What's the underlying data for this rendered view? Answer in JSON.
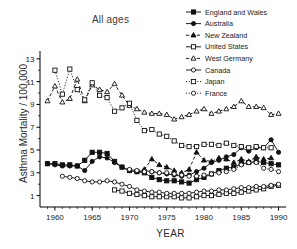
{
  "chart_data": {
    "type": "line",
    "title": "All ages",
    "xlabel": "YEAR",
    "ylabel": "Asthma Mortality / 100,000",
    "xlim": [
      1958,
      1991
    ],
    "ylim": [
      0,
      13.6
    ],
    "xticks": [
      1960,
      1965,
      1970,
      1975,
      1980,
      1985,
      1990
    ],
    "yticks": [
      1,
      3,
      5,
      7,
      9,
      11,
      13
    ],
    "yminor": [
      2,
      4,
      6,
      8,
      10,
      12
    ],
    "grid": false,
    "legend_position": "top-right",
    "series": [
      {
        "name": "England and Wales",
        "marker": "filled-square",
        "line": "solid",
        "color": "#111111",
        "points": [
          [
            1959,
            3.8
          ],
          [
            1960,
            3.8
          ],
          [
            1961,
            3.7
          ],
          [
            1962,
            3.7
          ],
          [
            1963,
            3.6
          ],
          [
            1964,
            4.1
          ],
          [
            1965,
            4.8
          ],
          [
            1966,
            4.8
          ],
          [
            1967,
            4.7
          ],
          [
            1968,
            4.0
          ],
          [
            1969,
            3.5
          ],
          [
            1970,
            3.2
          ],
          [
            1971,
            3.1
          ],
          [
            1972,
            3.0
          ],
          [
            1973,
            2.6
          ],
          [
            1974,
            2.4
          ],
          [
            1975,
            2.3
          ],
          [
            1976,
            2.3
          ],
          [
            1977,
            2.2
          ],
          [
            1978,
            2.1
          ],
          [
            1979,
            2.4
          ],
          [
            1980,
            2.6
          ],
          [
            1981,
            2.9
          ],
          [
            1982,
            3.2
          ],
          [
            1983,
            3.4
          ],
          [
            1984,
            3.5
          ],
          [
            1985,
            3.8
          ],
          [
            1986,
            3.9
          ],
          [
            1987,
            4.0
          ],
          [
            1988,
            3.9
          ],
          [
            1989,
            3.8
          ],
          [
            1990,
            3.7
          ]
        ]
      },
      {
        "name": "Australia",
        "marker": "filled-circle",
        "line": "solid",
        "color": "#111111",
        "points": [
          [
            1959,
            3.8
          ],
          [
            1960,
            3.7
          ],
          [
            1961,
            3.6
          ],
          [
            1962,
            3.6
          ],
          [
            1963,
            3.6
          ],
          [
            1964,
            3.2
          ],
          [
            1965,
            4.0
          ],
          [
            1966,
            4.4
          ],
          [
            1967,
            4.3
          ],
          [
            1968,
            3.9
          ],
          [
            1969,
            3.5
          ],
          [
            1970,
            3.2
          ],
          [
            1971,
            3.1
          ],
          [
            1972,
            3.2
          ],
          [
            1973,
            3.1
          ],
          [
            1974,
            3.0
          ],
          [
            1975,
            2.9
          ],
          [
            1976,
            2.8
          ],
          [
            1977,
            2.7
          ],
          [
            1978,
            2.8
          ],
          [
            1979,
            3.1
          ],
          [
            1980,
            3.4
          ],
          [
            1981,
            3.9
          ],
          [
            1982,
            4.1
          ],
          [
            1983,
            4.4
          ],
          [
            1984,
            4.6
          ],
          [
            1985,
            5.2
          ],
          [
            1986,
            4.9
          ],
          [
            1987,
            5.2
          ],
          [
            1988,
            5.2
          ],
          [
            1989,
            5.9
          ],
          [
            1990,
            4.8
          ]
        ]
      },
      {
        "name": "New Zealand",
        "marker": "filled-triangle",
        "line": "dashed",
        "color": "#111111",
        "points": [
          [
            1972,
            3.3
          ],
          [
            1973,
            4.2
          ],
          [
            1974,
            3.7
          ],
          [
            1975,
            3.5
          ],
          [
            1976,
            3.2
          ],
          [
            1977,
            3.0
          ],
          [
            1978,
            3.3
          ],
          [
            1979,
            4.8
          ],
          [
            1980,
            4.1
          ],
          [
            1981,
            4.0
          ],
          [
            1982,
            4.3
          ],
          [
            1983,
            4.2
          ],
          [
            1984,
            3.9
          ],
          [
            1985,
            4.2
          ],
          [
            1986,
            4.0
          ],
          [
            1987,
            4.4
          ],
          [
            1988,
            4.2
          ],
          [
            1989,
            4.3
          ]
        ]
      },
      {
        "name": "United States",
        "marker": "open-square",
        "line": "solid",
        "color": "#111111",
        "points": [
          [
            1968,
            1.5
          ],
          [
            1969,
            1.4
          ],
          [
            1970,
            1.2
          ],
          [
            1971,
            1.1
          ],
          [
            1972,
            1.0
          ],
          [
            1973,
            0.9
          ],
          [
            1974,
            0.9
          ],
          [
            1975,
            0.9
          ],
          [
            1976,
            0.9
          ],
          [
            1977,
            0.8
          ],
          [
            1978,
            0.8
          ],
          [
            1979,
            0.9
          ],
          [
            1980,
            1.0
          ],
          [
            1981,
            1.0
          ],
          [
            1982,
            1.1
          ],
          [
            1983,
            1.2
          ],
          [
            1984,
            1.2
          ],
          [
            1985,
            1.3
          ],
          [
            1986,
            1.4
          ],
          [
            1987,
            1.5
          ],
          [
            1988,
            1.6
          ],
          [
            1989,
            1.8
          ],
          [
            1990,
            1.9
          ]
        ]
      },
      {
        "name": "West Germany",
        "marker": "open-triangle",
        "line": "dashed",
        "color": "#111111",
        "points": [
          [
            1959,
            9.3
          ],
          [
            1960,
            10.6
          ],
          [
            1961,
            9.2
          ],
          [
            1962,
            9.5
          ],
          [
            1963,
            11.2
          ],
          [
            1964,
            9.3
          ],
          [
            1965,
            10.7
          ],
          [
            1966,
            10.3
          ],
          [
            1967,
            10.1
          ],
          [
            1968,
            10.8
          ],
          [
            1969,
            9.8
          ],
          [
            1970,
            8.9
          ],
          [
            1971,
            8.6
          ],
          [
            1972,
            8.3
          ],
          [
            1973,
            8.2
          ],
          [
            1974,
            8.2
          ],
          [
            1975,
            8.1
          ],
          [
            1976,
            7.7
          ],
          [
            1977,
            7.9
          ],
          [
            1978,
            8.1
          ],
          [
            1979,
            8.4
          ],
          [
            1980,
            8.6
          ],
          [
            1981,
            8.2
          ],
          [
            1982,
            8.4
          ],
          [
            1983,
            8.6
          ],
          [
            1984,
            8.8
          ],
          [
            1985,
            9.3
          ],
          [
            1986,
            8.8
          ],
          [
            1987,
            8.8
          ],
          [
            1988,
            8.7
          ],
          [
            1989,
            8.1
          ],
          [
            1990,
            8.2
          ]
        ]
      },
      {
        "name": "Canada",
        "marker": "open-circle",
        "line": "solid",
        "color": "#111111",
        "points": [
          [
            1961,
            2.7
          ],
          [
            1962,
            2.6
          ],
          [
            1963,
            2.5
          ],
          [
            1964,
            2.3
          ],
          [
            1965,
            2.2
          ],
          [
            1966,
            2.2
          ],
          [
            1967,
            2.3
          ],
          [
            1968,
            2.2
          ],
          [
            1969,
            2.0
          ],
          [
            1970,
            1.8
          ],
          [
            1971,
            1.5
          ],
          [
            1972,
            1.4
          ],
          [
            1973,
            1.3
          ],
          [
            1974,
            1.3
          ],
          [
            1975,
            1.2
          ],
          [
            1976,
            1.2
          ],
          [
            1977,
            1.2
          ],
          [
            1978,
            1.2
          ],
          [
            1979,
            1.3
          ],
          [
            1980,
            1.4
          ],
          [
            1981,
            1.4
          ],
          [
            1982,
            1.5
          ],
          [
            1983,
            1.5
          ],
          [
            1984,
            1.6
          ],
          [
            1985,
            1.7
          ],
          [
            1986,
            1.7
          ],
          [
            1987,
            1.8
          ],
          [
            1988,
            1.8
          ],
          [
            1989,
            1.9
          ],
          [
            1990,
            2.0
          ]
        ]
      },
      {
        "name": "Japan",
        "marker": "open-square",
        "line": "dotted",
        "color": "#111111",
        "points": [
          [
            1960,
            12.0
          ],
          [
            1961,
            9.9
          ],
          [
            1962,
            12.1
          ],
          [
            1963,
            10.3
          ],
          [
            1964,
            9.4
          ],
          [
            1965,
            10.9
          ],
          [
            1966,
            9.8
          ],
          [
            1967,
            9.6
          ],
          [
            1968,
            8.4
          ],
          [
            1969,
            8.7
          ],
          [
            1970,
            9.1
          ],
          [
            1971,
            7.6
          ],
          [
            1972,
            6.7
          ],
          [
            1973,
            6.8
          ],
          [
            1974,
            6.4
          ],
          [
            1975,
            6.2
          ],
          [
            1976,
            5.8
          ],
          [
            1977,
            5.4
          ],
          [
            1978,
            5.3
          ],
          [
            1979,
            5.3
          ],
          [
            1980,
            5.5
          ],
          [
            1981,
            5.5
          ],
          [
            1982,
            5.4
          ],
          [
            1983,
            5.6
          ],
          [
            1984,
            5.4
          ],
          [
            1985,
            5.3
          ],
          [
            1986,
            5.2
          ],
          [
            1987,
            5.3
          ],
          [
            1988,
            5.2
          ],
          [
            1989,
            5.2
          ]
        ]
      },
      {
        "name": "France",
        "marker": "open-circle",
        "line": "dotted",
        "color": "#111111",
        "points": [
          [
            1970,
            3.3
          ],
          [
            1971,
            3.2
          ],
          [
            1972,
            3.1
          ],
          [
            1973,
            3.1
          ],
          [
            1974,
            3.0
          ],
          [
            1975,
            3.0
          ],
          [
            1976,
            2.9
          ],
          [
            1977,
            2.8
          ],
          [
            1978,
            2.7
          ],
          [
            1979,
            2.7
          ],
          [
            1980,
            2.8
          ],
          [
            1981,
            2.9
          ],
          [
            1982,
            3.0
          ],
          [
            1983,
            3.1
          ],
          [
            1984,
            3.3
          ],
          [
            1985,
            3.7
          ],
          [
            1986,
            3.9
          ],
          [
            1987,
            3.9
          ],
          [
            1988,
            3.4
          ],
          [
            1989,
            3.3
          ],
          [
            1990,
            3.1
          ]
        ]
      }
    ]
  }
}
